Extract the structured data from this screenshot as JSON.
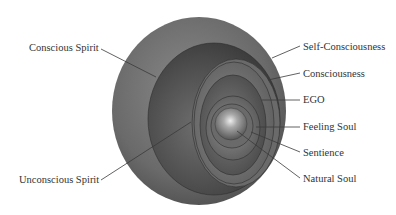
{
  "diagram": {
    "type": "nested-spheres",
    "colors": {
      "background": "#ffffff",
      "outer_sphere": "#6e6e6e",
      "leader_line": "#3a3a3a",
      "label_text": "#333333",
      "core_highlight": "#e8e8e8"
    },
    "labels_left": [
      {
        "id": "conscious-spirit",
        "text": "Conscious Spirit"
      },
      {
        "id": "unconscious-spirit",
        "text": "Unconscious Spirit"
      }
    ],
    "labels_right": [
      {
        "id": "self-consciousness",
        "text": "Self-Consciousness"
      },
      {
        "id": "consciousness",
        "text": "Consciousness"
      },
      {
        "id": "ego",
        "text": "EGO"
      },
      {
        "id": "feeling-soul",
        "text": "Feeling Soul"
      },
      {
        "id": "sentience",
        "text": "Sentience"
      },
      {
        "id": "natural-soul",
        "text": "Natural Soul"
      }
    ]
  }
}
